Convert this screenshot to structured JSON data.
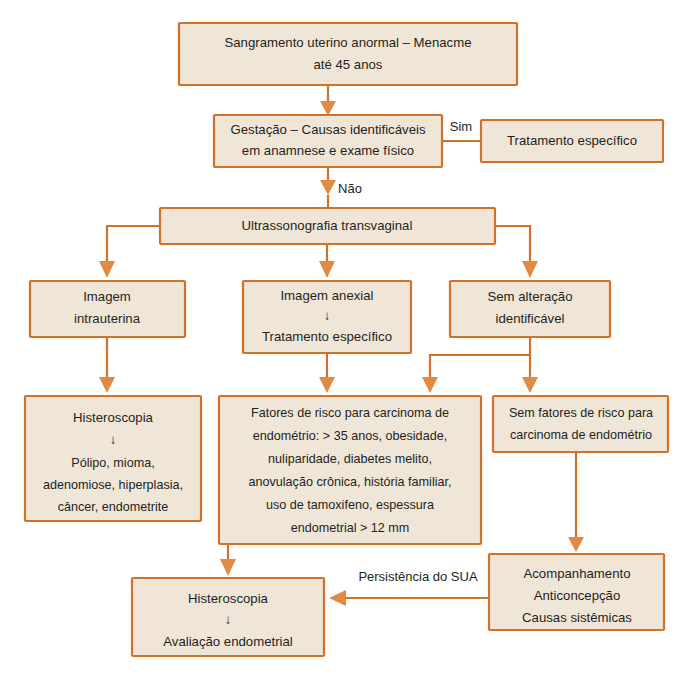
{
  "diagram": {
    "colors": {
      "box_fill": "#f0e6d8",
      "box_border": "#d2712a",
      "arrow": "#e08a46",
      "text": "#231f1c",
      "background": "#ffffff"
    },
    "nodes": [
      {
        "id": "n1",
        "name": "sangramento-uterino-box",
        "lines": [
          "Sangramento uterino anormal – Menacme",
          "até 45 anos"
        ],
        "x": 179,
        "y": 23,
        "w": 338,
        "h": 62
      },
      {
        "id": "n2",
        "name": "gestacao-causas-box",
        "lines": [
          "Gestação – Causas identificáveis",
          "em anamnese e exame físico"
        ],
        "x": 214,
        "y": 115,
        "w": 228,
        "h": 52
      },
      {
        "id": "n3",
        "name": "tratamento-especifico-box",
        "lines": [
          "Tratamento específico"
        ],
        "x": 481,
        "y": 120,
        "w": 182,
        "h": 42
      },
      {
        "id": "n4",
        "name": "ultrassonografia-transvaginal-box",
        "lines": [
          "Ultrassonografia transvaginal"
        ],
        "x": 160,
        "y": 208,
        "w": 335,
        "h": 36
      },
      {
        "id": "n5",
        "name": "imagem-intrauterina-box",
        "lines": [
          "Imagem",
          "intrauterina"
        ],
        "x": 30,
        "y": 281,
        "w": 155,
        "h": 56
      },
      {
        "id": "n6",
        "name": "imagem-anexial-box",
        "lines": [
          "Imagem anexial",
          "↓",
          "Tratamento específico"
        ],
        "x": 243,
        "y": 281,
        "w": 168,
        "h": 72
      },
      {
        "id": "n7",
        "name": "sem-alteracao-box",
        "lines": [
          "Sem alteração",
          "identificável"
        ],
        "x": 450,
        "y": 281,
        "w": 160,
        "h": 56
      },
      {
        "id": "n8",
        "name": "histeroscopia-polipo-box",
        "lines": [
          "Histeroscopia",
          "↓",
          "Pólipo, mioma,",
          "adenomiose, hiperplasia,",
          "câncer, endometrite"
        ],
        "x": 25,
        "y": 396,
        "w": 176,
        "h": 125
      },
      {
        "id": "n9",
        "name": "fatores-de-risco-box",
        "lines": [
          "Fatores de risco para carcinoma de",
          "endométrio: > 35 anos, obesidade,",
          "nuliparidade, diabetes melito,",
          "anovulação crônica, história familiar,",
          "uso de tamoxifeno, espessura",
          "endometrial > 12 mm"
        ],
        "x": 219,
        "y": 396,
        "w": 262,
        "h": 148
      },
      {
        "id": "n10",
        "name": "sem-fatores-de-risco-box",
        "lines": [
          "Sem fatores de risco para",
          "carcinoma de endométrio"
        ],
        "x": 493,
        "y": 396,
        "w": 175,
        "h": 56
      },
      {
        "id": "n11",
        "name": "acompanhamento-box",
        "lines": [
          "Acompanhamento",
          "Anticoncepção",
          "Causas sistêmicas"
        ],
        "x": 489,
        "y": 554,
        "w": 175,
        "h": 76
      },
      {
        "id": "n12",
        "name": "histeroscopia-avaliacao-box",
        "lines": [
          "Histeroscopia",
          "↓",
          "Avaliação endometrial"
        ],
        "x": 132,
        "y": 578,
        "w": 192,
        "h": 78
      }
    ],
    "edge_labels": [
      {
        "name": "edge-label-sim",
        "text": "Sim",
        "x": 461,
        "y": 128
      },
      {
        "name": "edge-label-nao",
        "text": "Não",
        "x": 345,
        "y": 190
      },
      {
        "name": "edge-label-persistencia",
        "text": "Persistência do SUA",
        "x": 418,
        "y": 578
      }
    ]
  }
}
